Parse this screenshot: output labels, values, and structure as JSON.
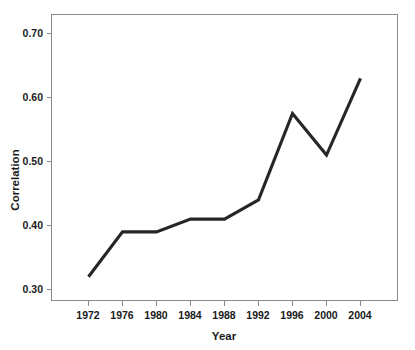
{
  "chart_data": {
    "type": "line",
    "title": "",
    "subtitle": "",
    "xlabel": "Year",
    "ylabel": "Correlation",
    "categories": [
      "1972",
      "1976",
      "1980",
      "1984",
      "1988",
      "1992",
      "1996",
      "2000",
      "2004"
    ],
    "x": [
      1972,
      1976,
      1980,
      1984,
      1988,
      1992,
      1996,
      2000,
      2004
    ],
    "values": [
      0.32,
      0.39,
      0.39,
      0.41,
      0.41,
      0.44,
      0.575,
      0.51,
      0.63
    ],
    "series": [
      {
        "name": "Correlation",
        "values": [
          0.32,
          0.39,
          0.39,
          0.41,
          0.41,
          0.44,
          0.575,
          0.51,
          0.63
        ],
        "color": "#262626"
      }
    ],
    "xlim": [
      1970,
      2006
    ],
    "ylim": [
      0.28,
      0.725
    ],
    "yticks": [
      0.3,
      0.4,
      0.5,
      0.6,
      0.7
    ],
    "ytick_labels": [
      "0.30",
      "0.40",
      "0.50",
      "0.60",
      "0.70"
    ],
    "xticks": [
      1972,
      1976,
      1980,
      1984,
      1988,
      1992,
      1996,
      2000,
      2004
    ],
    "xtick_labels": [
      "1972",
      "1976",
      "1980",
      "1984",
      "1988",
      "1992",
      "1996",
      "2000",
      "2004"
    ],
    "grid": false,
    "legend": false,
    "legend_position": "none",
    "annotations": [],
    "frame_color": "#8a8a8a",
    "line_color": "#262626",
    "background_color": "#ffffff"
  },
  "axes": {
    "y_title": "Correlation",
    "x_title": "Year",
    "y_tick_labels": [
      "0.70",
      "0.60",
      "0.50",
      "0.40",
      "0.30"
    ],
    "x_tick_labels": [
      "1972",
      "1976",
      "1980",
      "1984",
      "1988",
      "1992",
      "1996",
      "2000",
      "2004"
    ]
  }
}
